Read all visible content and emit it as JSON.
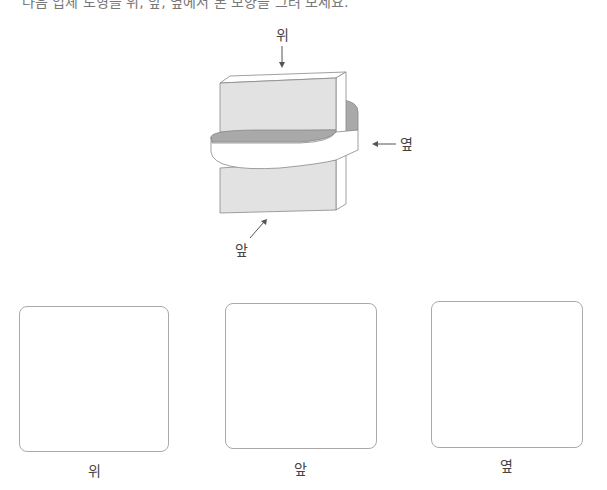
{
  "title_clipped": "다음 입체 도형을 위, 앞, 옆에서 본 모양을 그려 보세요.",
  "figure": {
    "labels": {
      "top": "위",
      "side": "옆",
      "front": "앞"
    },
    "colors": {
      "face_fill": "#e2e2e2",
      "shadow_fill": "#a9a9a9",
      "stroke": "#888888"
    }
  },
  "answer_boxes": [
    {
      "label": "위"
    },
    {
      "label": "앞"
    },
    {
      "label": "옆"
    }
  ]
}
